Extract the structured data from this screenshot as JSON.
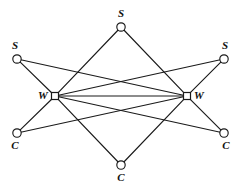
{
  "diagram": {
    "width": 240,
    "height": 192,
    "background_color": "#ffffff",
    "line_color": "#1a1a1a",
    "node_fill_color": "#ffffff",
    "label_color": "#111111"
  },
  "nodes": [
    {
      "id": "s_top",
      "label": "S",
      "shape": "circle",
      "x": 121,
      "y": 27,
      "r": 4.2,
      "label_x": 121,
      "label_y": 14,
      "label_pos": "above"
    },
    {
      "id": "s_left",
      "label": "S",
      "shape": "circle",
      "x": 17,
      "y": 59,
      "r": 4.2,
      "label_x": 15,
      "label_y": 46,
      "label_pos": "above"
    },
    {
      "id": "s_right",
      "label": "S",
      "shape": "circle",
      "x": 224,
      "y": 59,
      "r": 4.2,
      "label_x": 225,
      "label_y": 46,
      "label_pos": "above"
    },
    {
      "id": "w_left",
      "label": "W",
      "shape": "square",
      "x": 55,
      "y": 96,
      "r": 4.0,
      "label_x": 43,
      "label_y": 96,
      "label_pos": "left"
    },
    {
      "id": "w_right",
      "label": "W",
      "shape": "square",
      "x": 187,
      "y": 96,
      "r": 4.0,
      "label_x": 199,
      "label_y": 96,
      "label_pos": "right"
    },
    {
      "id": "c_left",
      "label": "C",
      "shape": "circle",
      "x": 17,
      "y": 133,
      "r": 4.2,
      "label_x": 15,
      "label_y": 146,
      "label_pos": "below"
    },
    {
      "id": "c_right",
      "label": "C",
      "shape": "circle",
      "x": 224,
      "y": 133,
      "r": 4.2,
      "label_x": 226,
      "label_y": 146,
      "label_pos": "below"
    },
    {
      "id": "c_bottom",
      "label": "C",
      "shape": "circle",
      "x": 121,
      "y": 165,
      "r": 4.2,
      "label_x": 121,
      "label_y": 178,
      "label_pos": "below"
    }
  ],
  "edges": [
    {
      "from": "s_left",
      "to": "w_left"
    },
    {
      "from": "s_left",
      "to": "w_right"
    },
    {
      "from": "c_left",
      "to": "w_left"
    },
    {
      "from": "c_left",
      "to": "w_right"
    },
    {
      "from": "s_right",
      "to": "w_right"
    },
    {
      "from": "s_right",
      "to": "w_left"
    },
    {
      "from": "c_right",
      "to": "w_right"
    },
    {
      "from": "c_right",
      "to": "w_left"
    },
    {
      "from": "s_top",
      "to": "w_left"
    },
    {
      "from": "s_top",
      "to": "w_right"
    },
    {
      "from": "c_bottom",
      "to": "w_left"
    },
    {
      "from": "c_bottom",
      "to": "w_right"
    },
    {
      "from": "w_left",
      "to": "w_right"
    }
  ]
}
